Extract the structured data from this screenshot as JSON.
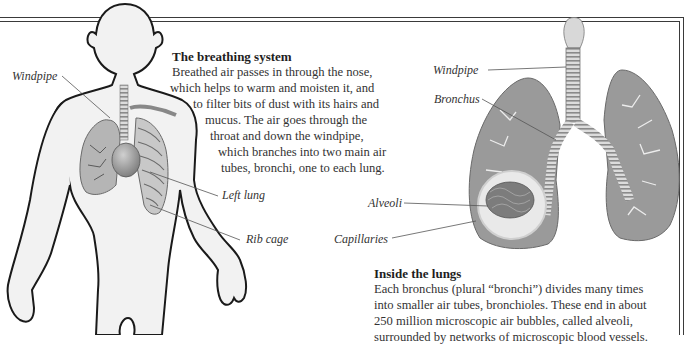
{
  "left_panel": {
    "heading": "The breathing system",
    "paragraph_lines": [
      "Breathed air passes in through the nose,",
      "which helps to warm and moisten it, and",
      "to filter bits of dust with its hairs and",
      "mucus. The air goes through the",
      "throat and down the windpipe,",
      "which branches into two main air",
      "tubes, bronchi, one to each lung."
    ],
    "labels": {
      "windpipe": "Windpipe",
      "left_lung": "Left lung",
      "rib_cage": "Rib cage"
    }
  },
  "right_panel": {
    "heading": "Inside the lungs",
    "paragraph_lines": [
      "Each bronchus (plural “bronchi”) divides many times",
      "into smaller air tubes, bronchioles. These end in about",
      "250 million microscopic air bubbles, called alveoli,",
      "surrounded by networks of microscopic blood vessels."
    ],
    "labels": {
      "windpipe": "Windpipe",
      "bronchus": "Bronchus",
      "alveoli": "Alveoli",
      "capillaries": "Capillaries"
    }
  },
  "colors": {
    "frame": "#3a3a3a",
    "body_fill": "#f2f2f2",
    "organ_gray": "#8c8c8c",
    "text": "#333333"
  }
}
